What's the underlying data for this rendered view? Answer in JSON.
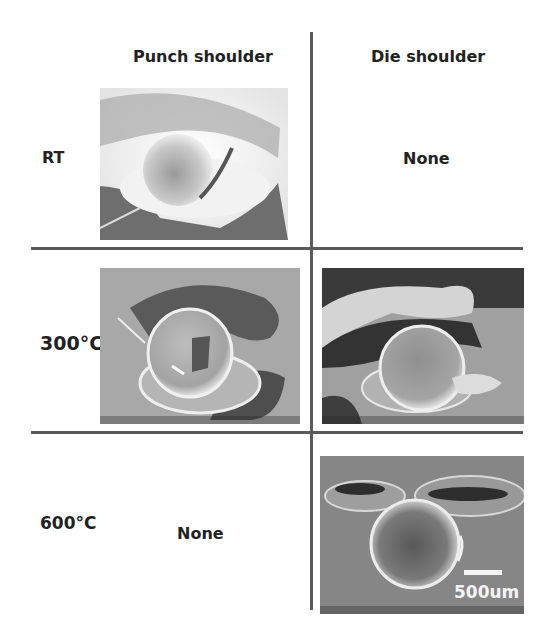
{
  "figure": {
    "columns": [
      {
        "id": "punch",
        "label": "Punch shoulder"
      },
      {
        "id": "die",
        "label": "Die shoulder"
      }
    ],
    "rows": [
      {
        "id": "rt",
        "label": "RT"
      },
      {
        "id": "t300",
        "label": "300°C"
      },
      {
        "id": "t600",
        "label": "600°C"
      }
    ],
    "cells": {
      "rt_punch": {
        "type": "image",
        "description": "SEM image: partially formed bump, punch shoulder, room temperature"
      },
      "rt_die": {
        "type": "text",
        "text": "None"
      },
      "t300_punch": {
        "type": "image",
        "description": "SEM image: bump with crack, punch shoulder, 300°C"
      },
      "t300_die": {
        "type": "image",
        "description": "SEM image: bump, die shoulder, 300°C"
      },
      "t600_punch": {
        "type": "text",
        "text": "None"
      },
      "t600_die": {
        "type": "image",
        "description": "SEM image: spherical bump, die shoulder, 600°C",
        "scale_bar": "500um"
      }
    },
    "colors": {
      "grid_line": "#5a5a5a",
      "text": "#222222",
      "background": "#ffffff"
    }
  }
}
